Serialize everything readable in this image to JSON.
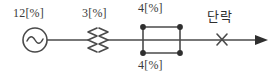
{
  "diagram": {
    "type": "single-line-power-system-diagram",
    "stroke_color": "#4a4a4a",
    "text_color": "#3a3a3a",
    "background": "#ffffff",
    "main_line_y": 40,
    "source": {
      "symbol": "ac-source",
      "label": "12[%]",
      "value": 12,
      "unit": "[%]",
      "cx": 35,
      "cy": 40,
      "r": 12
    },
    "transformer": {
      "symbol": "transformer-zigzag",
      "label": "3[%]",
      "value": 3,
      "unit": "[%]",
      "x": 98,
      "y": 40
    },
    "parallel_lines": [
      {
        "position": "top",
        "label": "4[%]",
        "value": 4,
        "unit": "[%]"
      },
      {
        "position": "bottom",
        "label": "4[%]",
        "value": 4,
        "unit": "[%]"
      }
    ],
    "junction_dots": 4,
    "fault": {
      "label": "단락",
      "meaning": "short-circuit",
      "marker": "x-mark",
      "x": 222,
      "y": 40
    },
    "arrow": {
      "direction": "right",
      "tip_x": 268,
      "y": 40
    }
  }
}
